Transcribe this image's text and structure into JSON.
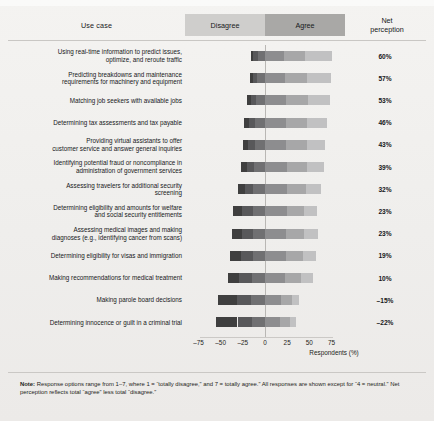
{
  "header": {
    "use_case": "Use case",
    "disagree": "Disagree",
    "agree": "Agree",
    "net_line1": "Net",
    "net_line2": "perception"
  },
  "note": {
    "prefix": "Note:",
    "text": " Response options range from 1–7, where 1 = “totally disagree,” and 7 = totally agree.” All responses are shown except for “4 = neutral.” Net perception reflects total “agree” less total “disagree.”"
  },
  "colors": {
    "disagree_1": "#3f3f3f",
    "disagree_2": "#58585a",
    "disagree_3": "#707072",
    "agree_5": "#8d8d8f",
    "agree_6": "#a7a7a8",
    "agree_7": "#c1c1c2",
    "header_disagree_band": "#cfcecc",
    "header_agree_band": "#a9a8a6",
    "page_bg": "#f1f0ee"
  },
  "chart_data": {
    "type": "bar",
    "subtype": "diverging-stacked-likert",
    "title": "",
    "xlabel": "Respondents (%)",
    "ylabel": "",
    "xlim": [
      -75,
      75
    ],
    "xticks": [
      -75,
      -50,
      -25,
      0,
      25,
      50,
      75
    ],
    "xtick_labels": [
      "–75",
      "–50",
      "–25",
      "0",
      "25",
      "50",
      "75"
    ],
    "grid": false,
    "legend_position": "top",
    "scale_note": "1–7 Likert; 4 = neutral excluded",
    "series": [
      {
        "name": "Totally disagree (1)",
        "side": "disagree",
        "color": "#3f3f3f"
      },
      {
        "name": "Disagree (2)",
        "side": "disagree",
        "color": "#58585a"
      },
      {
        "name": "Somewhat disagree (3)",
        "side": "disagree",
        "color": "#707072"
      },
      {
        "name": "Somewhat agree (5)",
        "side": "agree",
        "color": "#8d8d8f"
      },
      {
        "name": "Agree (6)",
        "side": "agree",
        "color": "#a7a7a8"
      },
      {
        "name": "Totally agree (7)",
        "side": "agree",
        "color": "#c1c1c2"
      }
    ],
    "categories": [
      "Using real-time information to predict issues, optimize, and reroute traffic",
      "Predicting breakdowns and maintenance requirements for machinery and equipment",
      "Matching job seekers with available jobs",
      "Determining tax assessments and tax payable",
      "Providing virtual assistants to offer customer service and answer general inquiries",
      "Identifying potential fraud or noncompliance in administration of government services",
      "Assessing travelers for additional security screening",
      "Determining eligibility and amounts for welfare and social security entitlements",
      "Assessing medical images and making diagnoses (e.g., identifying cancer from scans)",
      "Determining eligibility for visas and immigration",
      "Making recommendations for medical treatment",
      "Making parole board decisions",
      "Determining innocence or guilt in a criminal trial"
    ],
    "net_perception": [
      60,
      57,
      53,
      46,
      43,
      39,
      32,
      23,
      23,
      19,
      10,
      -15,
      -22
    ],
    "net_perception_labels": [
      "60%",
      "57%",
      "53%",
      "46%",
      "43%",
      "39%",
      "32%",
      "23%",
      "23%",
      "19%",
      "10%",
      "–15%",
      "–22%"
    ],
    "rows": [
      {
        "label": "Using real-time information to predict issues, optimize, and reroute traffic",
        "label_lines": [
          "Using real-time information to predict issues,",
          "optimize, and reroute traffic"
        ],
        "disagree": [
          3,
          5,
          8
        ],
        "agree": [
          21,
          24,
          31
        ],
        "net": "60%"
      },
      {
        "label": "Predicting breakdowns and maintenance requirements for machinery and equipment",
        "label_lines": [
          "Predicting breakdowns and maintenance",
          "requirements for machinery and equipment"
        ],
        "disagree": [
          3,
          5,
          9
        ],
        "agree": [
          22,
          25,
          27
        ],
        "net": "57%"
      },
      {
        "label": "Matching job seekers with available jobs",
        "label_lines": [
          "Matching job seekers with available jobs"
        ],
        "disagree": [
          4,
          6,
          10
        ],
        "agree": [
          24,
          25,
          24
        ],
        "net": "53%"
      },
      {
        "label": "Determining tax assessments and tax payable",
        "label_lines": [
          "Determining tax assessments and tax payable"
        ],
        "disagree": [
          6,
          7,
          11
        ],
        "agree": [
          24,
          23,
          23
        ],
        "net": "46%"
      },
      {
        "label": "Providing virtual assistants to offer customer service and answer general inquiries",
        "label_lines": [
          "Providing virtual assistants to offer",
          "customer service and answer general inquiries"
        ],
        "disagree": [
          6,
          8,
          11
        ],
        "agree": [
          24,
          23,
          21
        ],
        "net": "43%"
      },
      {
        "label": "Identifying potential fraud or noncompliance in administration of government services",
        "label_lines": [
          "Identifying potential fraud or noncompliance in",
          "administration of government services"
        ],
        "disagree": [
          7,
          8,
          12
        ],
        "agree": [
          25,
          22,
          19
        ],
        "net": "39%"
      },
      {
        "label": "Assessing travelers for additional security screening",
        "label_lines": [
          "Assessing travelers for additional security",
          "screening"
        ],
        "disagree": [
          8,
          10,
          13
        ],
        "agree": [
          25,
          21,
          17
        ],
        "net": "32%"
      },
      {
        "label": "Determining eligibility and amounts for welfare and social security entitlements",
        "label_lines": [
          "Determining eligibility and amounts for welfare",
          "and social security entitlements"
        ],
        "disagree": [
          10,
          12,
          14
        ],
        "agree": [
          25,
          19,
          15
        ],
        "net": "23%"
      },
      {
        "label": "Assessing medical images and making diagnoses (e.g., identifying cancer from scans)",
        "label_lines": [
          "Assessing medical images and making",
          "diagnoses (e.g., identifying cancer from scans)"
        ],
        "disagree": [
          11,
          12,
          14
        ],
        "agree": [
          24,
          20,
          16
        ],
        "net": "23%"
      },
      {
        "label": "Determining eligibility for visas and immigration",
        "label_lines": [
          "Determining eligibility for visas and immigration"
        ],
        "disagree": [
          12,
          13,
          14
        ],
        "agree": [
          24,
          19,
          15
        ],
        "net": "19%"
      },
      {
        "label": "Making recommendations for medical treatment",
        "label_lines": [
          "Making recommendations for medical treatment"
        ],
        "disagree": [
          13,
          14,
          15
        ],
        "agree": [
          23,
          18,
          13
        ],
        "net": "10%"
      },
      {
        "label": "Making parole board decisions",
        "label_lines": [
          "Making parole board decisions"
        ],
        "disagree": [
          21,
          16,
          16
        ],
        "agree": [
          18,
          12,
          8
        ],
        "net": "–15%"
      },
      {
        "label": "Determining innocence or guilt in a criminal trial",
        "label_lines": [
          "Determining innocence or guilt in a criminal trial"
        ],
        "disagree": [
          24,
          16,
          15
        ],
        "agree": [
          17,
          11,
          7
        ],
        "net": "–22%"
      }
    ]
  }
}
